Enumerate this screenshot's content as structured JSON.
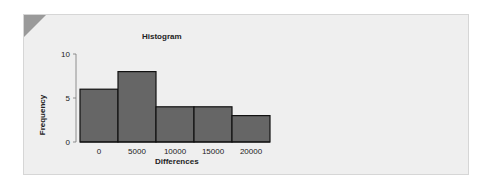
{
  "chart_data": {
    "type": "bar",
    "title": "Histogram",
    "xlabel": "Differences",
    "ylabel": "Frequency",
    "categories": [
      "0",
      "5000",
      "10000",
      "15000",
      "20000"
    ],
    "values": [
      6,
      8,
      4,
      4,
      3
    ],
    "bin_centers": [
      0,
      5000,
      10000,
      15000,
      20000
    ],
    "bin_width": 5000,
    "ylim": [
      0,
      10
    ],
    "yticks": [
      0,
      5,
      10
    ],
    "xticks": [
      "0",
      "5000",
      "10000",
      "15000",
      "20000"
    ],
    "grid": false,
    "legend": null,
    "colors": {
      "bar_fill": "#666666",
      "bar_edge": "#111111",
      "background": "#efefef",
      "corner_accent": "#9a9a9a"
    }
  },
  "card": {
    "title": "Histogram",
    "xlabel": "Differences",
    "ylabel": "Frequency"
  }
}
